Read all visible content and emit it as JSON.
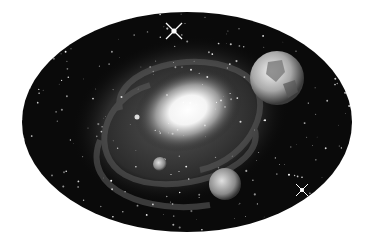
{
  "image": {
    "description": "Black and white illustration of a spiral galaxy inside an oval frame with planets and twinkling stars",
    "colors": {
      "background": "#ffffff",
      "space": "#0a0a0a",
      "core": "#ffffff"
    },
    "objects": [
      {
        "name": "galaxy-core",
        "label": "Bright galactic core"
      },
      {
        "name": "earth-like-planet",
        "label": "Large planet (upper right)"
      },
      {
        "name": "small-planet",
        "label": "Small planet"
      },
      {
        "name": "medium-planet",
        "label": "Medium planet (lower)"
      },
      {
        "name": "twinkle-star-top",
        "label": "Star sparkle"
      },
      {
        "name": "twinkle-star-bottom-right",
        "label": "Star sparkle"
      }
    ]
  }
}
